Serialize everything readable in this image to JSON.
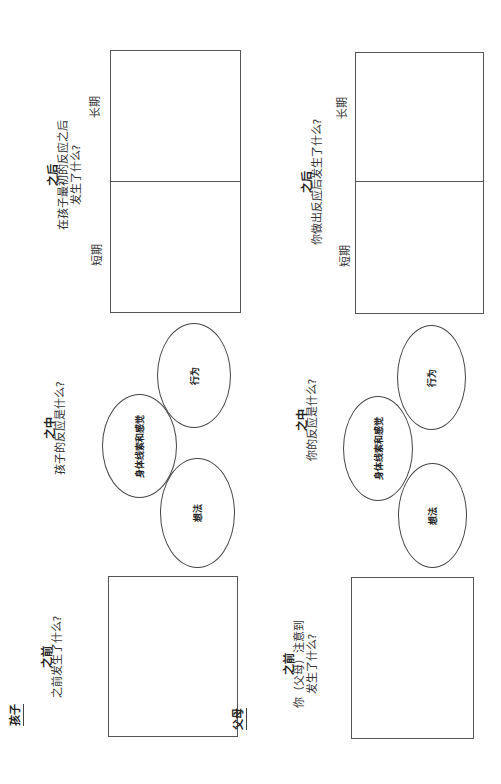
{
  "child": {
    "section_label": "孩子",
    "before": {
      "heading": "之前",
      "question_lines": [
        "之前发生了什么?"
      ]
    },
    "during": {
      "heading": "之中",
      "question_lines": [
        "孩子的反应是什么?"
      ],
      "circles": {
        "thoughts": "想法",
        "body_cues": "身体线索和感觉",
        "behavior": "行为"
      }
    },
    "after": {
      "heading": "之后",
      "question_lines": [
        "在孩子最初的反应之后",
        "发生了什么?"
      ],
      "short_term": "短期",
      "long_term": "长期"
    }
  },
  "parent": {
    "section_label": "父母",
    "before": {
      "heading": "之前",
      "question_lines": [
        "你（父母）注意到",
        "发生了什么?"
      ]
    },
    "during": {
      "heading": "之中",
      "question_lines": [
        "你的反应是什么?"
      ],
      "circles": {
        "thoughts": "想法",
        "body_cues": "身体线索和感觉",
        "behavior": "行为"
      }
    },
    "after": {
      "heading": "之后",
      "question_lines": [
        "你做出反应后发生了什么?"
      ],
      "short_term": "短期",
      "long_term": "长期"
    }
  }
}
